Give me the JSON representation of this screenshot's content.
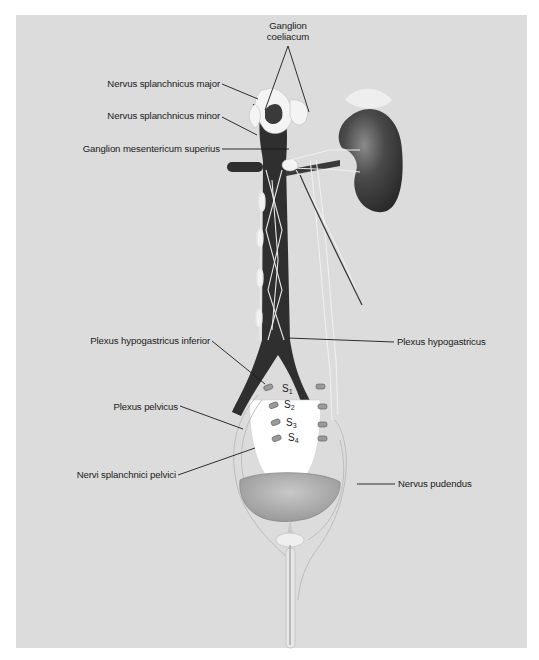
{
  "figure": {
    "background_color": "#dcdcdc",
    "vessel_color": "#2f2f2f",
    "nerve_color": "#f2f2f2",
    "labels": {
      "ganglion_coeliacum_line1": "Ganglion",
      "ganglion_coeliacum_line2": "coeliacum",
      "splanchnicus_major": "Nervus splanchnicus major",
      "splanchnicus_minor": "Nervus splanchnicus minor",
      "mesentericum_superius": "Ganglion mesentericum superius",
      "hypogastricus_inferior": "Plexus hypogastricus inferior",
      "hypogastricus": "Plexus hypogastricus",
      "pelvicus": "Plexus pelvicus",
      "splanchnici_pelvici": "Nervi splanchnici pelvici",
      "pudendus": "Nervus pudendus"
    },
    "sacral_segments": [
      {
        "letter": "S",
        "sub": "1"
      },
      {
        "letter": "S",
        "sub": "2"
      },
      {
        "letter": "S",
        "sub": "3"
      },
      {
        "letter": "S",
        "sub": "4"
      }
    ]
  }
}
